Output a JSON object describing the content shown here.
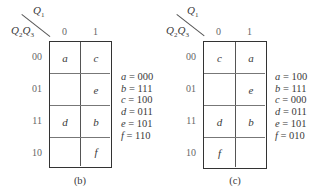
{
  "maps": [
    {
      "id": "b",
      "caption": "(b)",
      "col_var": "Q",
      "col_var_sub": "1",
      "row_var": "Q",
      "row_var_sub1": "2",
      "row_var2": "Q",
      "row_var_sub2": "3",
      "col_headers": [
        "0",
        "1"
      ],
      "row_headers": [
        "00",
        "01",
        "11",
        "10"
      ],
      "cells": [
        [
          "a",
          "c"
        ],
        [
          "",
          "e"
        ],
        [
          "d",
          "b"
        ],
        [
          "",
          "f"
        ]
      ],
      "assignments": [
        {
          "var": "a",
          "eq": " = 000"
        },
        {
          "var": "b",
          "eq": " = 111"
        },
        {
          "var": "c",
          "eq": " = 100"
        },
        {
          "var": "d",
          "eq": " = 011"
        },
        {
          "var": "e",
          "eq": " = 101"
        },
        {
          "var": "f",
          "eq": " = 110"
        }
      ]
    },
    {
      "id": "c",
      "caption": "(c)",
      "col_var": "Q",
      "col_var_sub": "1",
      "row_var": "Q",
      "row_var_sub1": "2",
      "row_var2": "Q",
      "row_var_sub2": "3",
      "col_headers": [
        "0",
        "1"
      ],
      "row_headers": [
        "00",
        "01",
        "11",
        "10"
      ],
      "cells": [
        [
          "c",
          "a"
        ],
        [
          "",
          "e"
        ],
        [
          "d",
          "b"
        ],
        [
          "f",
          ""
        ]
      ],
      "assignments": [
        {
          "var": "a",
          "eq": " = 100"
        },
        {
          "var": "b",
          "eq": " = 111"
        },
        {
          "var": "c",
          "eq": " = 000"
        },
        {
          "var": "d",
          "eq": " = 011"
        },
        {
          "var": "e",
          "eq": " = 101"
        },
        {
          "var": "f",
          "eq": " = 010"
        }
      ]
    }
  ]
}
